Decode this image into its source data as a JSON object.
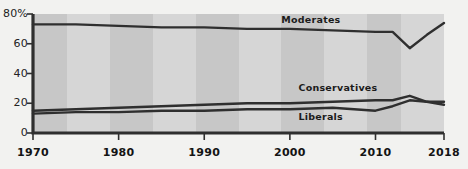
{
  "chart_data": {
    "type": "line",
    "title": "",
    "xlabel": "",
    "ylabel": "",
    "xlim": [
      1970,
      2018
    ],
    "ylim": [
      0,
      80
    ],
    "grid": false,
    "legend_position": "inline-annotations",
    "y_ticks": [
      "0",
      "20",
      "40",
      "60",
      "80%"
    ],
    "y_tick_values": [
      0,
      20,
      40,
      60,
      80
    ],
    "x_ticks": [
      "1970",
      "1980",
      "1990",
      "2000",
      "2010",
      "2018"
    ],
    "x_tick_values": [
      1970,
      1980,
      1990,
      2000,
      2010,
      2018
    ],
    "series": [
      {
        "name": "Moderates",
        "color": "#2f2f2f",
        "label_x": 1999,
        "label_y": 76,
        "x": [
          1970,
          1975,
          1980,
          1985,
          1990,
          1995,
          2000,
          2005,
          2010,
          2012,
          2014,
          2016,
          2018
        ],
        "values": [
          73,
          73,
          72,
          71,
          71,
          70,
          70,
          69,
          68,
          68,
          57,
          66,
          74
        ]
      },
      {
        "name": "Conservatives",
        "color": "#2f2f2f",
        "label_x": 2001,
        "label_y": 30,
        "x": [
          1970,
          1975,
          1980,
          1985,
          1990,
          1995,
          2000,
          2005,
          2010,
          2012,
          2014,
          2016,
          2018
        ],
        "values": [
          15,
          16,
          17,
          18,
          19,
          20,
          20,
          21,
          22,
          22,
          25,
          21,
          19
        ]
      },
      {
        "name": "Liberals",
        "color": "#2f2f2f",
        "label_x": 2001,
        "label_y": 11,
        "x": [
          1970,
          1975,
          1980,
          1985,
          1990,
          1995,
          2000,
          2005,
          2010,
          2012,
          2014,
          2016,
          2018
        ],
        "values": [
          13,
          14,
          14,
          15,
          15,
          16,
          16,
          17,
          15,
          18,
          22,
          21,
          21
        ]
      }
    ],
    "background_bands": [
      {
        "start": 1970,
        "end": 1974,
        "color": "#c7c7c7"
      },
      {
        "start": 1974,
        "end": 1979,
        "color": "#d6d6d6"
      },
      {
        "start": 1979,
        "end": 1984,
        "color": "#c7c7c7"
      },
      {
        "start": 1984,
        "end": 1989,
        "color": "#d6d6d6"
      },
      {
        "start": 1989,
        "end": 1994,
        "color": "#c7c7c7"
      },
      {
        "start": 1994,
        "end": 1999,
        "color": "#d6d6d6"
      },
      {
        "start": 1999,
        "end": 2004,
        "color": "#c7c7c7"
      },
      {
        "start": 2004,
        "end": 2009,
        "color": "#d6d6d6"
      },
      {
        "start": 2009,
        "end": 2013,
        "color": "#c7c7c7"
      },
      {
        "start": 2013,
        "end": 2018,
        "color": "#d6d6d6"
      }
    ],
    "axis_color": "#2f2f2f",
    "page_background": "#f2f2f0"
  }
}
